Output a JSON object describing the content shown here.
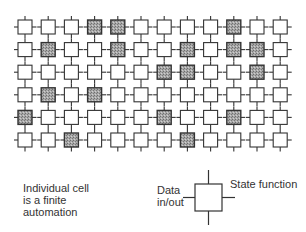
{
  "diagram": {
    "grid": {
      "rows": 6,
      "cols": 12,
      "shaded_cells": [
        [
          0,
          3
        ],
        [
          0,
          4
        ],
        [
          0,
          9
        ],
        [
          1,
          1
        ],
        [
          1,
          4
        ],
        [
          1,
          7
        ],
        [
          1,
          9
        ],
        [
          1,
          10
        ],
        [
          2,
          6
        ],
        [
          2,
          7
        ],
        [
          2,
          10
        ],
        [
          3,
          1
        ],
        [
          3,
          3
        ],
        [
          4,
          0
        ],
        [
          4,
          6
        ],
        [
          4,
          9
        ],
        [
          5,
          2
        ],
        [
          5,
          7
        ]
      ],
      "colors": {
        "cell_stroke": "#333333",
        "cell_fill": "#ffffff",
        "shaded_fill": "#9a9a9a"
      }
    },
    "caption": {
      "line1": "Individual cell",
      "line2": "is a finite",
      "line3": "automation"
    },
    "legend": {
      "data_label_line1": "Data",
      "data_label_line2": "in/out",
      "state_label": "State function"
    }
  }
}
